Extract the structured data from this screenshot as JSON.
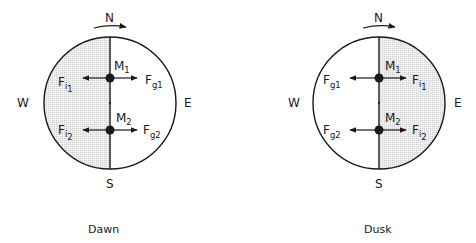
{
  "panels": [
    {
      "caption": "Dawn",
      "shaded_side": "west",
      "compass": {
        "north": "N",
        "south": "S",
        "west": "W",
        "east": "E"
      },
      "masses": [
        {
          "label": "M",
          "sub": "1",
          "left_force": {
            "F": "F",
            "sub": "i",
            "subsub": "1"
          },
          "right_force": {
            "F": "F",
            "sub": "g",
            "subsub": "1"
          }
        },
        {
          "label": "M",
          "sub": "2",
          "left_force": {
            "F": "F",
            "sub": "i",
            "subsub": "2"
          },
          "right_force": {
            "F": "F",
            "sub": "g",
            "subsub": "2"
          }
        }
      ]
    },
    {
      "caption": "Dusk",
      "shaded_side": "east",
      "compass": {
        "north": "N",
        "south": "S",
        "west": "W",
        "east": "E"
      },
      "masses": [
        {
          "label": "M",
          "sub": "1",
          "left_force": {
            "F": "F",
            "sub": "g",
            "subsub": "1"
          },
          "right_force": {
            "F": "F",
            "sub": "i",
            "subsub": "1"
          }
        },
        {
          "label": "M",
          "sub": "2",
          "left_force": {
            "F": "F",
            "sub": "g",
            "subsub": "2"
          },
          "right_force": {
            "F": "F",
            "sub": "i",
            "subsub": "2"
          }
        }
      ]
    }
  ],
  "colors": {
    "line": "#1a1a1a",
    "shade": "#e8e8e8"
  }
}
